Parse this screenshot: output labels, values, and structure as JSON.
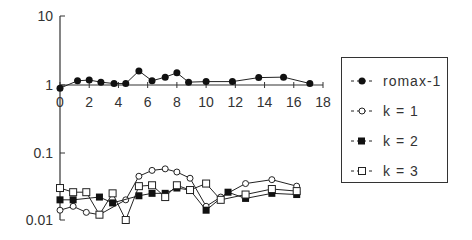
{
  "chart_data": [
    {
      "type": "line",
      "panel": "top",
      "yscale": "log",
      "ylim": [
        0.7,
        10
      ],
      "xlim": [
        0,
        18
      ],
      "y_ticks": [
        {
          "value": 10,
          "label": "10"
        },
        {
          "value": 1,
          "label": "1"
        }
      ],
      "x_ticks": [
        0,
        2,
        4,
        6,
        8,
        10,
        12,
        14,
        16,
        18
      ],
      "x_tick_labels": [
        "0",
        "2",
        "4",
        "6",
        "8",
        "10",
        "12",
        "14",
        "16",
        "18"
      ],
      "series": [
        {
          "name": "romax-1",
          "marker": "filled-circle",
          "x": [
            0,
            1.2,
            2.0,
            2.8,
            3.7,
            4.5,
            5.4,
            6.3,
            7.2,
            8.0,
            8.8,
            10.0,
            11.8,
            13.6,
            15.3,
            17.1
          ],
          "values": [
            0.9,
            1.15,
            1.18,
            1.1,
            1.05,
            1.05,
            1.6,
            1.15,
            1.3,
            1.5,
            1.1,
            1.12,
            1.12,
            1.28,
            1.3,
            1.05
          ]
        }
      ]
    },
    {
      "type": "line",
      "panel": "bottom",
      "yscale": "log",
      "ylim": [
        0.01,
        0.15
      ],
      "xlim": [
        0,
        18
      ],
      "y_ticks": [
        {
          "value": 0.1,
          "label": "0.1"
        },
        {
          "value": 0.01,
          "label": "0.01"
        }
      ],
      "series": [
        {
          "name": "k = 1",
          "marker": "open-circle",
          "x": [
            0,
            0.9,
            1.8,
            2.7,
            4.5,
            5.4,
            6.3,
            7.2,
            8.0,
            8.9,
            10.0,
            11.0,
            12.7,
            14.5,
            16.2
          ],
          "values": [
            0.014,
            0.016,
            0.013,
            0.012,
            0.02,
            0.045,
            0.055,
            0.058,
            0.052,
            0.042,
            0.016,
            0.022,
            0.035,
            0.04,
            0.032
          ]
        },
        {
          "name": "k = 2",
          "marker": "filled-square",
          "x": [
            0,
            0.9,
            2.7,
            3.6,
            5.4,
            6.3,
            7.2,
            8.0,
            8.9,
            10.0,
            11.5,
            12.7,
            14.5,
            16.2
          ],
          "values": [
            0.02,
            0.02,
            0.022,
            0.018,
            0.023,
            0.025,
            0.025,
            0.03,
            0.028,
            0.014,
            0.026,
            0.021,
            0.025,
            0.024
          ]
        },
        {
          "name": "k = 3",
          "marker": "open-square",
          "x": [
            0,
            0.9,
            1.8,
            2.7,
            3.6,
            4.5,
            5.4,
            6.3,
            7.2,
            8.0,
            8.9,
            10.0,
            11.0,
            12.7,
            14.5,
            16.2
          ],
          "values": [
            0.03,
            0.026,
            0.026,
            0.012,
            0.025,
            0.01,
            0.032,
            0.033,
            0.022,
            0.033,
            0.028,
            0.035,
            0.02,
            0.024,
            0.029,
            0.027
          ]
        }
      ]
    }
  ],
  "legend": {
    "position": "right",
    "items": [
      {
        "label": "romax-1",
        "marker": "filled-circle"
      },
      {
        "label": "k = 1",
        "marker": "open-circle"
      },
      {
        "label": "k = 2",
        "marker": "filled-square"
      },
      {
        "label": "k = 3",
        "marker": "open-square"
      }
    ]
  },
  "style": {
    "line_color": "#222222",
    "axis_color": "#333333",
    "background": "#ffffff"
  }
}
